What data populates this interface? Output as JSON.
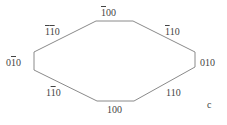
{
  "diagram": {
    "shape": "octagon",
    "stroke_color": "#888888",
    "faces": [
      {
        "id": "top",
        "label_parts": [
          {
            "t": "1",
            "bar": true
          },
          {
            "t": "00",
            "bar": false
          }
        ]
      },
      {
        "id": "upper-left",
        "label_parts": [
          {
            "t": "1",
            "bar": true
          },
          {
            "t": "1",
            "bar": true
          },
          {
            "t": "0",
            "bar": false
          }
        ]
      },
      {
        "id": "upper-right",
        "label_parts": [
          {
            "t": "1",
            "bar": true
          },
          {
            "t": "10",
            "bar": false
          }
        ]
      },
      {
        "id": "left",
        "label_parts": [
          {
            "t": "0",
            "bar": false
          },
          {
            "t": "1",
            "bar": true
          },
          {
            "t": "0",
            "bar": false
          }
        ]
      },
      {
        "id": "right",
        "label_parts": [
          {
            "t": "010",
            "bar": false
          }
        ]
      },
      {
        "id": "lower-left",
        "label_parts": [
          {
            "t": "1",
            "bar": false
          },
          {
            "t": "1",
            "bar": true
          },
          {
            "t": "0",
            "bar": false
          }
        ]
      },
      {
        "id": "lower-right",
        "label_parts": [
          {
            "t": "110",
            "bar": false
          }
        ]
      },
      {
        "id": "bottom",
        "label_parts": [
          {
            "t": "100",
            "bar": false
          }
        ]
      }
    ],
    "panel_label": "c"
  }
}
